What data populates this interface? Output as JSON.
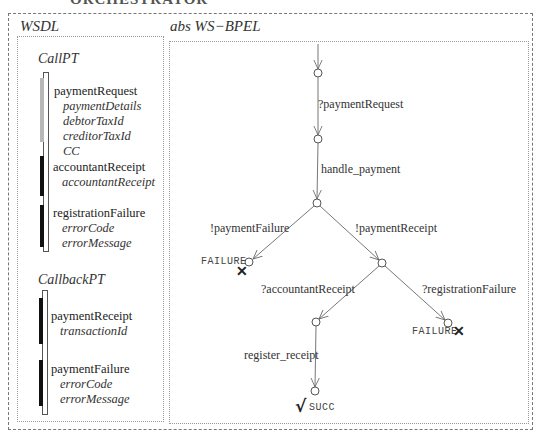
{
  "top_title_fragment": "ORCHESTRATOR",
  "wsdl": {
    "title": "WSDL",
    "port_types": [
      {
        "name": "CallPT",
        "operations": [
          {
            "name": "paymentRequest",
            "params": [
              "paymentDetails",
              "debtorTaxId",
              "creditorTaxId",
              "CC"
            ],
            "bar_color": "#b8b8b8"
          },
          {
            "name": "accountantReceipt",
            "params": [
              "accountantReceipt"
            ],
            "bar_color": "#111111"
          },
          {
            "name": "registrationFailure",
            "params": [
              "errorCode",
              "errorMessage"
            ],
            "bar_color": "#111111"
          }
        ]
      },
      {
        "name": "CallbackPT",
        "operations": [
          {
            "name": "paymentReceipt",
            "params": [
              "transactionId"
            ],
            "bar_color": "#111111"
          },
          {
            "name": "paymentFailure",
            "params": [
              "errorCode",
              "errorMessage"
            ],
            "bar_color": "#111111"
          }
        ]
      }
    ]
  },
  "bpel": {
    "title": "abs WS−BPEL",
    "transitions": {
      "t1": "?paymentRequest",
      "t2": "handle_payment",
      "t3": "!paymentFailure",
      "t4": "!paymentReceipt",
      "t5": "?accountantReceipt",
      "t6": "?registrationFailure",
      "t7": "register_receipt"
    },
    "final_states": {
      "failure_left": "FAILURE",
      "failure_right": "FAILURE",
      "success": "SUCC"
    },
    "markers": {
      "failure_mark": "✕",
      "success_mark": "√"
    }
  }
}
